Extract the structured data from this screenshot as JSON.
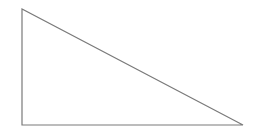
{
  "diagram": {
    "shape": "right-triangle",
    "stroke_color": "#7a7a7a",
    "fill_color": "#ffffff",
    "stroke_width": 1.2,
    "vertices": {
      "top": [
        22,
        9
      ],
      "bottom_left": [
        22,
        125
      ],
      "bottom_right": [
        243,
        125
      ]
    }
  }
}
